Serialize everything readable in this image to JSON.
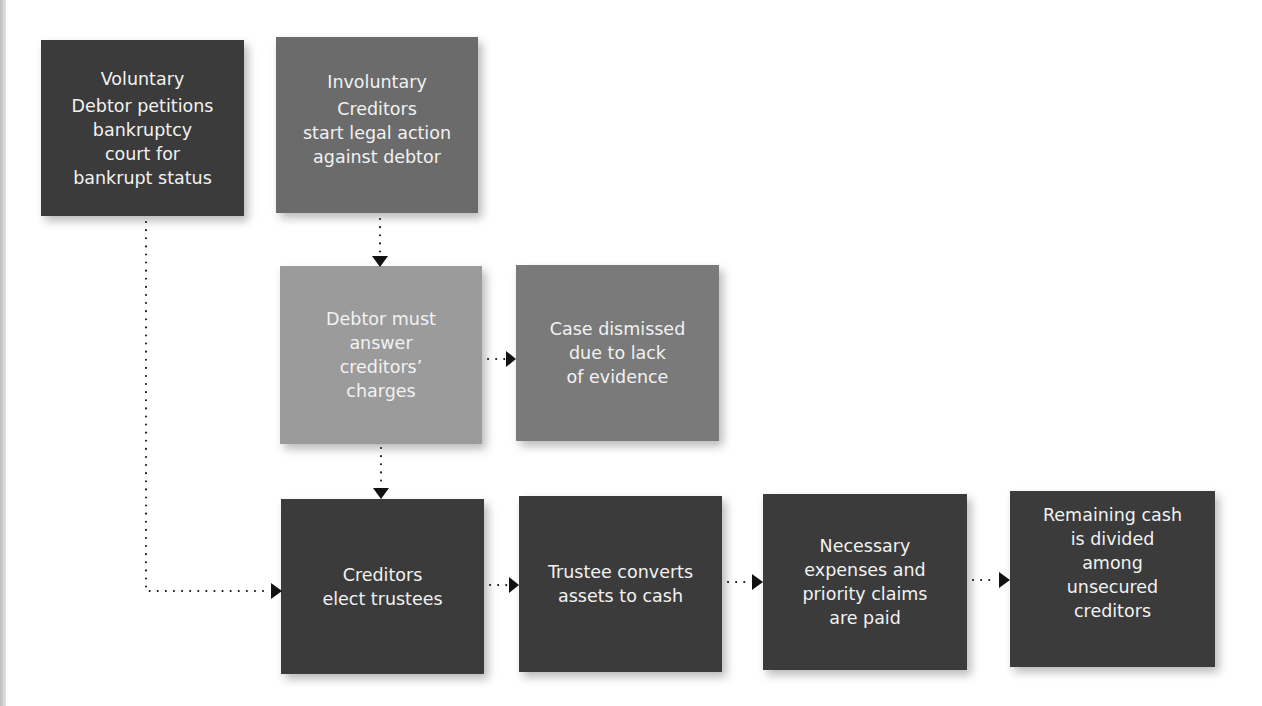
{
  "colors": {
    "dark": "#3b3b3b",
    "medium": "#6b6b6b",
    "light": "#9b9b9b",
    "dismissed": "#7a7a7a",
    "text": "#f2f2f2",
    "connector": "#111111"
  },
  "nodes": {
    "voluntary": {
      "title": "Voluntary",
      "body": "Debtor petitions\nbankruptcy\ncourt for\nbankrupt status"
    },
    "involuntary": {
      "title": "Involuntary",
      "body": "Creditors\nstart legal action\nagainst debtor"
    },
    "debtor_must_answer": {
      "body": "Debtor must\nanswer\ncreditors’\ncharges"
    },
    "case_dismissed": {
      "body": "Case dismissed\ndue to lack\nof evidence"
    },
    "creditors_elect": {
      "body": "Creditors\nelect trustees"
    },
    "trustee_converts": {
      "body": "Trustee converts\nassets to cash"
    },
    "expenses_paid": {
      "body": "Necessary\nexpenses and\npriority claims\nare paid"
    },
    "remaining_cash": {
      "body": "Remaining cash\nis divided\namong\nunsecured\ncreditors"
    }
  },
  "edges": [
    {
      "from": "involuntary",
      "to": "debtor_must_answer",
      "style": "dotted-arrow"
    },
    {
      "from": "debtor_must_answer",
      "to": "case_dismissed",
      "style": "dotted-arrow"
    },
    {
      "from": "debtor_must_answer",
      "to": "creditors_elect",
      "style": "dotted-arrow"
    },
    {
      "from": "voluntary",
      "to": "creditors_elect",
      "style": "dotted-arrow-elbow"
    },
    {
      "from": "creditors_elect",
      "to": "trustee_converts",
      "style": "dotted-arrow"
    },
    {
      "from": "trustee_converts",
      "to": "expenses_paid",
      "style": "dotted-arrow"
    },
    {
      "from": "expenses_paid",
      "to": "remaining_cash",
      "style": "dotted-arrow"
    }
  ]
}
